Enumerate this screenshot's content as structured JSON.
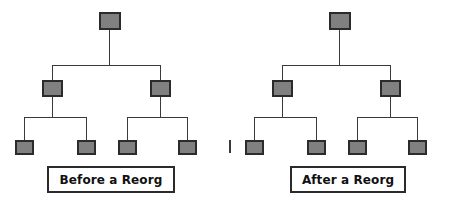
{
  "figure": {
    "background_color": "#ffffff",
    "node_fill_color": "#808080",
    "node_border_color": "#2b2b2b",
    "line_color": "#3a3a3a",
    "caption_text_color": "#111111"
  },
  "divider": {
    "name": "center-divider-tick"
  },
  "diagrams": [
    {
      "id": "before",
      "caption": "Before a Reorg",
      "nodes": {
        "root": {
          "label": ""
        },
        "mid": [
          {
            "label": ""
          },
          {
            "label": ""
          }
        ],
        "leaf": [
          {
            "label": ""
          },
          {
            "label": ""
          },
          {
            "label": ""
          },
          {
            "label": ""
          }
        ]
      }
    },
    {
      "id": "after",
      "caption": "After a Reorg",
      "nodes": {
        "root": {
          "label": ""
        },
        "mid": [
          {
            "label": ""
          },
          {
            "label": ""
          }
        ],
        "leaf": [
          {
            "label": ""
          },
          {
            "label": ""
          },
          {
            "label": ""
          },
          {
            "label": ""
          }
        ]
      }
    }
  ]
}
